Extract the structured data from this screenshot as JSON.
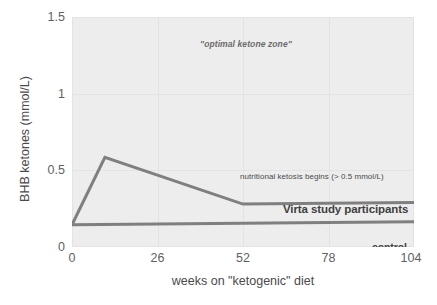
{
  "chart_data": {
    "type": "line",
    "title": "",
    "xlabel": "weeks on \"ketogenic\" diet",
    "ylabel": "BHB ketones (mmol/L)",
    "xlim": [
      0,
      104
    ],
    "ylim": [
      0,
      1.5
    ],
    "xticks": [
      "0",
      "26",
      "52",
      "78",
      "104"
    ],
    "xtick_values": [
      0,
      26,
      52,
      78,
      104
    ],
    "yticks": [
      "0",
      "0.5",
      "1",
      "1.5"
    ],
    "ytick_values": [
      0,
      0.5,
      1,
      1.5
    ],
    "grid": true,
    "legend_position": "inline-labels",
    "series": [
      {
        "name": "Virta study participants",
        "color": "#7f7f7f",
        "x": [
          0,
          10,
          52,
          104
        ],
        "values": [
          0.145,
          0.585,
          0.28,
          0.29
        ]
      },
      {
        "name": "control",
        "color": "#7f7f7f",
        "x": [
          0,
          104
        ],
        "values": [
          0.145,
          0.165
        ]
      }
    ],
    "annotations": [
      {
        "id": "optimal-zone",
        "text": "\"optimal ketone zone\"",
        "x": 44,
        "y": 1.41,
        "style": "italic-bold"
      },
      {
        "id": "nutritional-ketosis",
        "text": "nutritional ketosis begins (> 0.5 mmol/L)",
        "x": 58,
        "y": 0.545,
        "style": "plain"
      },
      {
        "id": "virta-series-label",
        "text": "Virta study participants",
        "x": 72,
        "y": 0.345,
        "style": "bold"
      },
      {
        "id": "control-series-label",
        "text": "control",
        "x": 97,
        "y": 0.095,
        "style": "bold"
      }
    ],
    "colors": {
      "plot_background": "#ededed",
      "gridline": "#e3e3e3",
      "line": "#7f7f7f",
      "tick_text": "#5f5f5f",
      "axis_title": "#4a4a4a",
      "page_background": "#ffffff"
    }
  }
}
